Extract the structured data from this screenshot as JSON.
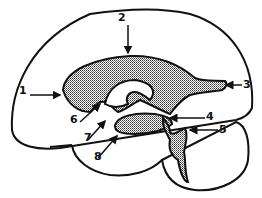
{
  "diagram": {
    "fill_pattern": "stippled",
    "colors": {
      "stroke": "#111111",
      "fill": "#bdbdbd",
      "background": "#ffffff"
    },
    "labels": [
      {
        "id": "1",
        "text": "1",
        "x": 22,
        "y": 90
      },
      {
        "id": "2",
        "text": "2",
        "x": 118,
        "y": 14
      },
      {
        "id": "3",
        "text": "3",
        "x": 243,
        "y": 83
      },
      {
        "id": "4",
        "text": "4",
        "x": 206,
        "y": 113
      },
      {
        "id": "5",
        "text": "5",
        "x": 218,
        "y": 124
      },
      {
        "id": "6",
        "text": "6",
        "x": 71,
        "y": 117
      },
      {
        "id": "7",
        "text": "7",
        "x": 84,
        "y": 136
      },
      {
        "id": "8",
        "text": "8",
        "x": 93,
        "y": 155
      }
    ]
  }
}
